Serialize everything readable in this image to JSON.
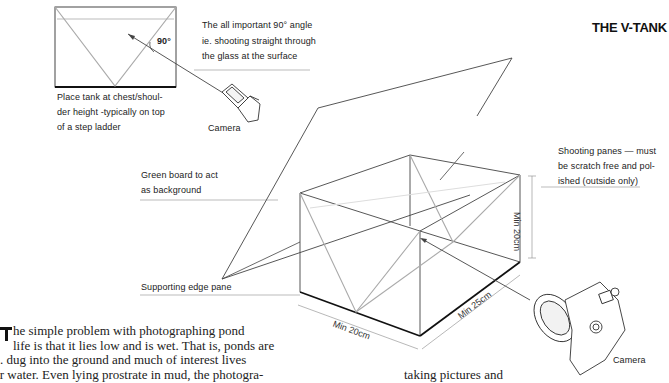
{
  "title": "THE V-TANK",
  "annotations": {
    "angle_note": [
      "The all important 90° angle",
      "ie. shooting straight through",
      "the glass at the surface"
    ],
    "angle_mark": "90°",
    "placement_note": [
      "Place tank at chest/shoul-",
      "der height -typically on top",
      "of a step ladder"
    ],
    "camera_small": "Camera",
    "green_board": [
      "Green board to act",
      "as background"
    ],
    "supporting_edge": "Supporting edge pane",
    "shooting_panes": [
      "Shooting panes — must",
      "be scratch free and pol-",
      "ished (outside only)"
    ],
    "camera_large": "Camera"
  },
  "dimensions": {
    "height": "Min 20cm",
    "width": "Min 20cm",
    "depth": "Min 25cm"
  },
  "body_text": {
    "dropcap": "T",
    "lines": [
      "he simple problem with photographing pond",
      "life is that it lies low and is wet. That is, ponds are",
      ". dug into the ground and much of interest lives",
      "er water. Even lying prostrate in mud, the photogra-"
    ],
    "right_column_fragment": "taking pictures and"
  }
}
